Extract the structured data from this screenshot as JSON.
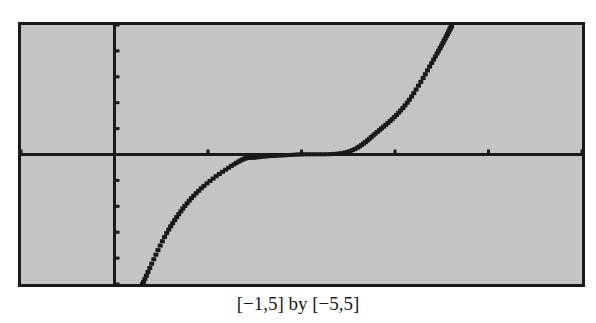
{
  "caption": "[−1,5] by [−5,5]",
  "colors": {
    "screen_bg": "#c4c4c4",
    "axis": "#1a1a1a",
    "curve": "#1a1a1a",
    "frame": "#1a1a1a"
  },
  "chart_data": {
    "type": "line",
    "title": "",
    "xlabel": "",
    "ylabel": "",
    "window": {
      "xmin": -1,
      "xmax": 5,
      "xscl": 1,
      "ymin": -5,
      "ymax": 5,
      "yscl": 1
    },
    "xlim": [
      -1,
      5
    ],
    "ylim": [
      -5,
      5
    ],
    "grid": false,
    "legend": null,
    "caption": "[−1,5] by [−5,5]",
    "series": [
      {
        "name": "y = f(x)",
        "x": [
          0.3,
          0.58,
          0.9,
          1.33,
          1.54,
          1.96,
          2.49,
          2.81,
          3.13,
          3.45,
          3.61
        ],
        "y": [
          -5.0,
          -2.9,
          -1.4,
          -0.27,
          -0.1,
          0.0,
          0.1,
          0.87,
          2.0,
          3.9,
          5.0
        ]
      }
    ]
  }
}
